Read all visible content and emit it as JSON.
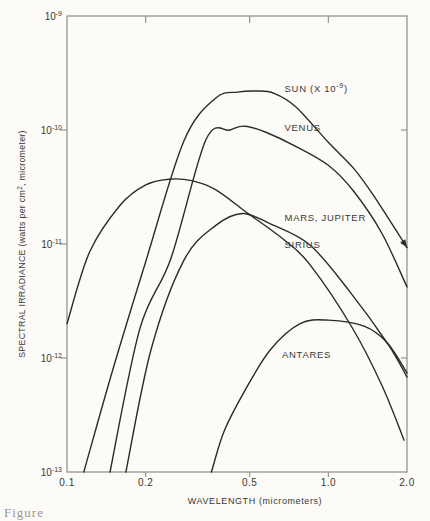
{
  "figure": {
    "caption_fragment": "Figure",
    "colors": {
      "background": "#fcfbf8",
      "curve": "#2c2a27",
      "frame": "#8e8c87",
      "text": "#3a3832",
      "caption": "#9a978f"
    }
  },
  "chart_data": {
    "type": "line",
    "title": "",
    "x_scale": "log",
    "y_scale": "log",
    "xlim": [
      0.1,
      2.0
    ],
    "ylim": [
      1e-13,
      1e-09
    ],
    "grid": false,
    "legend_position": "inline-labels",
    "xlabel": "WAVELENGTH (micrometers)",
    "ylabel": "SPECTRAL IRRADIANCE (watts per cm2, micrometer)",
    "ylabel_parts": {
      "prefix": "SPECTRAL IRRADIANCE (watts per cm",
      "sup": "2",
      "suffix": ", micrometer)"
    },
    "x_ticks": [
      {
        "value": 0.1,
        "label": "0.1"
      },
      {
        "value": 0.2,
        "label": "0.2"
      },
      {
        "value": 0.5,
        "label": "0.5"
      },
      {
        "value": 1.0,
        "label": "1.0"
      },
      {
        "value": 2.0,
        "label": "2.0"
      }
    ],
    "y_ticks": [
      {
        "value": 1e-09,
        "base": "10",
        "exp": "-9"
      },
      {
        "value": 1e-10,
        "base": "10",
        "exp": "-10"
      },
      {
        "value": 1e-11,
        "base": "10",
        "exp": "-11"
      },
      {
        "value": 1e-12,
        "base": "10",
        "exp": "-12"
      },
      {
        "value": 1e-13,
        "base": "10",
        "exp": "-13"
      }
    ],
    "series": [
      {
        "name": "sun",
        "label": "SUN (X 10-9)",
        "label_parts": {
          "prefix": "SUN (X 10",
          "sup": "-9",
          "suffix": ")"
        },
        "label_at": [
          0.68,
          2.3e-10
        ],
        "end_arrow": true,
        "x": [
          0.116,
          0.15,
          0.2,
          0.28,
          0.37,
          0.45,
          0.53,
          0.62,
          0.75,
          1.0,
          1.25,
          1.5,
          2.0
        ],
        "y": [
          1e-13,
          8e-13,
          7e-12,
          8e-11,
          1.9e-10,
          2.15e-10,
          2.2e-10,
          2.1e-10,
          1.6e-10,
          7.8e-11,
          4.6e-11,
          2.6e-11,
          9.3e-12
        ]
      },
      {
        "name": "venus",
        "label": "VENUS",
        "label_at": [
          0.68,
          1.04e-10
        ],
        "end_arrow": false,
        "x": [
          0.146,
          0.19,
          0.25,
          0.34,
          0.42,
          0.48,
          0.58,
          0.75,
          1.0,
          1.25,
          1.6,
          2.0
        ],
        "y": [
          1e-13,
          1.8e-12,
          7.5e-12,
          8.2e-11,
          1e-10,
          1.08e-10,
          9.5e-11,
          7.2e-11,
          4.9e-11,
          2.9e-11,
          1.25e-11,
          4.2e-12
        ]
      },
      {
        "name": "mars-jupiter",
        "label": "MARS, JUPITER",
        "label_at": [
          0.68,
          1.7e-11
        ],
        "end_arrow": false,
        "x": [
          0.168,
          0.21,
          0.28,
          0.37,
          0.47,
          0.6,
          0.85,
          1.2,
          1.7,
          2.0
        ],
        "y": [
          1e-13,
          1.2e-12,
          7.2e-12,
          1.45e-11,
          1.85e-11,
          1.5e-11,
          9.8e-12,
          3.9e-12,
          1.3e-12,
          6.8e-13
        ]
      },
      {
        "name": "sirius",
        "label": "SIRIUS",
        "label_at": [
          0.68,
          9.8e-12
        ],
        "end_arrow": false,
        "x": [
          0.1,
          0.122,
          0.16,
          0.2,
          0.245,
          0.3,
          0.37,
          0.49,
          0.68,
          0.85,
          1.23,
          1.6,
          1.95
        ],
        "y": [
          2e-12,
          8.5e-12,
          2.2e-11,
          3.3e-11,
          3.7e-11,
          3.6e-11,
          3e-11,
          1.87e-11,
          1.08e-11,
          6.6e-12,
          1.87e-12,
          5.8e-13,
          1.9e-13
        ]
      },
      {
        "name": "antares",
        "label": "ANTARES",
        "label_at": [
          0.665,
          1.06e-12
        ],
        "end_arrow": false,
        "x": [
          0.357,
          0.4,
          0.48,
          0.6,
          0.78,
          1.0,
          1.37,
          1.68,
          2.0
        ],
        "y": [
          1e-13,
          2.3e-13,
          5.2e-13,
          1.18e-12,
          2e-12,
          2.15e-12,
          1.9e-12,
          1.36e-12,
          7.4e-13
        ]
      }
    ]
  }
}
